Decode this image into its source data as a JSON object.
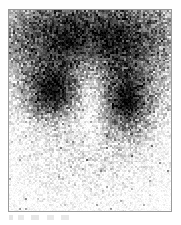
{
  "image": {
    "kind": "nuclear-medicine-scintigram",
    "modality_label": "planar scintigraphy",
    "orientation": "posterior",
    "width_px": 181,
    "height_px": 225,
    "background_color": "#ffffff",
    "frame": {
      "border_color": "#9a9a9a",
      "border_width_px": 1,
      "left_px": 8,
      "top_px": 9,
      "width_px": 164,
      "height_px": 203,
      "inner_background": "#ffffff"
    },
    "caption": {
      "text": "",
      "legible": false,
      "note": "faint illegible smudge beneath frame"
    },
    "colormap": {
      "type": "grayscale-inverted",
      "hot_color": "#000000",
      "cold_color": "#ffffff",
      "description": "high radiotracer uptake renders dark, low uptake renders light"
    },
    "noise": {
      "character": "poisson-speckle",
      "grain_size_px": 2,
      "visible": true
    },
    "regions": [
      {
        "name": "upper-uptake-band",
        "label": "diffuse dense uptake across upper field",
        "intensity": "very-high",
        "center_x_pct": 50,
        "center_y_pct": 14,
        "radius_x_pct": 52,
        "radius_y_pct": 22,
        "opacity": 0.97
      },
      {
        "name": "right-renal-lobe",
        "label": "right kidney focal uptake",
        "intensity": "very-high",
        "center_x_pct": 27,
        "center_y_pct": 40,
        "radius_x_pct": 15,
        "radius_y_pct": 13,
        "opacity": 0.95
      },
      {
        "name": "left-renal-lobe",
        "label": "left kidney focal uptake",
        "intensity": "very-high",
        "center_x_pct": 73,
        "center_y_pct": 45,
        "radius_x_pct": 14,
        "radius_y_pct": 17,
        "opacity": 0.96
      },
      {
        "name": "central-spine-column",
        "label": "relative photopenic midline column",
        "intensity": "reduced",
        "center_x_pct": 50,
        "center_y_pct": 35,
        "radius_x_pct": 8,
        "radius_y_pct": 26,
        "opacity": 0.3
      },
      {
        "name": "lower-soft-tissue",
        "label": "low background activity in lower field",
        "intensity": "low",
        "center_x_pct": 48,
        "center_y_pct": 76,
        "radius_x_pct": 34,
        "radius_y_pct": 22,
        "opacity": 0.16
      }
    ]
  }
}
